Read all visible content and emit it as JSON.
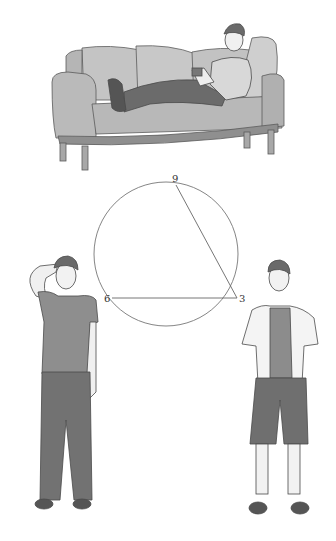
{
  "figure": {
    "circle": {
      "center": [
        166,
        244
      ],
      "radius": 69,
      "points": [
        {
          "label": "9",
          "x": 172,
          "y": 184
        },
        {
          "label": "6",
          "x": 107,
          "y": 298
        },
        {
          "label": "3",
          "x": 236,
          "y": 298
        }
      ],
      "chords": [
        [
          "9",
          "3"
        ],
        [
          "6",
          "3"
        ]
      ]
    },
    "scenes": [
      {
        "id": "sofa",
        "description": "person reclining on sofa holding phone"
      },
      {
        "id": "left-figure",
        "description": "person standing with hand on head, t-shirt and long trousers"
      },
      {
        "id": "right-figure",
        "description": "person standing with hands in pockets, open shirt and shorts"
      }
    ]
  },
  "colors": {
    "line": "#555555",
    "sofa": "#bdbdbd",
    "sofa_dark": "#9e9e9e",
    "shirt_gray": "#8c8c8c",
    "pants_dark": "#6f6f6f",
    "skin": "#f2f2f2",
    "hair": "#6a6a6a"
  }
}
